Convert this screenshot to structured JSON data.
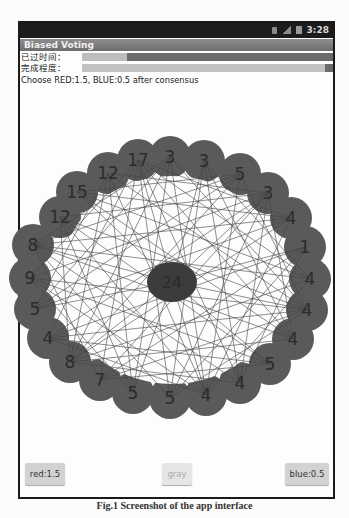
{
  "statusbar": {
    "time": "3:28",
    "icons": [
      "sd-card-icon",
      "signal-icon",
      "battery-icon"
    ]
  },
  "app": {
    "title": "Biased Voting",
    "elapsed_label": "已过时间：",
    "elapsed_progress_start": 0.18,
    "elapsed_progress_end": 1.0,
    "completion_label": "完成程度：",
    "completion_progress": 0.97,
    "note": "Choose RED:1.5, BLUE:0.5 after consensus"
  },
  "graph": {
    "ring_color": "#5a5a5a",
    "center_color": "#3c3c3c",
    "edge_color": "#444444",
    "center_node": {
      "label": "24",
      "x": 172,
      "y": 282
    },
    "nodes": [
      {
        "label": "17",
        "x": 138,
        "y": 160
      },
      {
        "label": "3",
        "x": 170,
        "y": 157
      },
      {
        "label": "3",
        "x": 204,
        "y": 161
      },
      {
        "label": "5",
        "x": 240,
        "y": 174
      },
      {
        "label": "3",
        "x": 268,
        "y": 193
      },
      {
        "label": "4",
        "x": 291,
        "y": 218
      },
      {
        "label": "1",
        "x": 305,
        "y": 247
      },
      {
        "label": "4",
        "x": 310,
        "y": 279
      },
      {
        "label": "4",
        "x": 307,
        "y": 310
      },
      {
        "label": "4",
        "x": 293,
        "y": 339
      },
      {
        "label": "5",
        "x": 270,
        "y": 364
      },
      {
        "label": "4",
        "x": 240,
        "y": 383
      },
      {
        "label": "4",
        "x": 206,
        "y": 395
      },
      {
        "label": "5",
        "x": 170,
        "y": 398
      },
      {
        "label": "5",
        "x": 133,
        "y": 393
      },
      {
        "label": "7",
        "x": 100,
        "y": 380
      },
      {
        "label": "8",
        "x": 70,
        "y": 362
      },
      {
        "label": "4",
        "x": 48,
        "y": 338
      },
      {
        "label": "5",
        "x": 35,
        "y": 309
      },
      {
        "label": "9",
        "x": 30,
        "y": 278
      },
      {
        "label": "8",
        "x": 33,
        "y": 245
      },
      {
        "label": "12",
        "x": 60,
        "y": 217
      },
      {
        "label": "15",
        "x": 77,
        "y": 192
      },
      {
        "label": "12",
        "x": 108,
        "y": 173
      }
    ]
  },
  "buttons": {
    "red_label": "red:1.5",
    "gray_label": "gray",
    "blue_label": "blue:0.5"
  },
  "caption": "Fig.1 Screenshot of the app interface"
}
